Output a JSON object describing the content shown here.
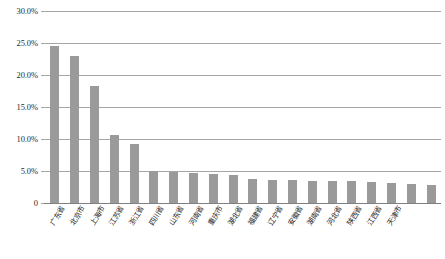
{
  "chart_data": {
    "type": "bar",
    "title": "",
    "subtitle": "",
    "xlabel": "",
    "ylabel": "",
    "ylim": [
      0,
      0.3
    ],
    "grid": true,
    "legend": false,
    "legend_position": "none",
    "bar_color": "#9a9a9a",
    "gridline_color": "#a6a6a6",
    "y_tick_labels": [
      "30.0%",
      "25.0%",
      "20.0%",
      "15.0%",
      "10.0%",
      "5.0%",
      "0"
    ],
    "y_tick_values": [
      0.3,
      0.25,
      0.2,
      0.15,
      0.1,
      0.05,
      0
    ],
    "categories": [
      "广东省",
      "北京市",
      "上海市",
      "江苏省",
      "浙江省",
      "四川省",
      "山东省",
      "河南省",
      "重庆市",
      "湖北省",
      "福建省",
      "辽宁省",
      "安徽省",
      "湖南省",
      "河北省",
      "陕西省",
      "江西省",
      "天津市",
      "",
      ""
    ],
    "values": [
      0.245,
      0.23,
      0.183,
      0.106,
      0.092,
      0.05,
      0.048,
      0.047,
      0.045,
      0.044,
      0.037,
      0.036,
      0.036,
      0.035,
      0.034,
      0.034,
      0.033,
      0.032,
      0.03,
      0.028
    ],
    "value_labels": [
      "24.5%",
      "23.0%",
      "18.3%",
      "10.6%",
      "9.2%",
      "5.0%",
      "4.8%",
      "4.7%",
      "4.5%",
      "4.4%",
      "3.7%",
      "3.6%",
      "3.6%",
      "3.5%",
      "3.4%",
      "3.4%",
      "3.3%",
      "3.2%",
      "3.0%",
      "2.8%"
    ]
  }
}
